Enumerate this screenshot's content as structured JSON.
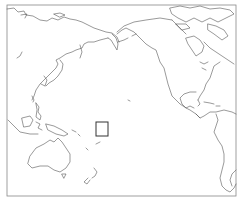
{
  "map": {
    "projection": "Pacific-centered equirectangular",
    "frame": {
      "x": 7,
      "y": 5,
      "width": 229,
      "height": 191,
      "stroke": "#888888"
    },
    "coastline_color": "#555555",
    "background": "#ffffff",
    "regions": [
      "Russia / Siberia",
      "Japan",
      "Korea",
      "China coast",
      "Philippines",
      "Indonesia",
      "Papua New Guinea",
      "Australia",
      "New Zealand",
      "Pacific Islands",
      "Alaska",
      "Canada",
      "Canadian Arctic Archipelago",
      "Greenland (partial)",
      "United States",
      "Mexico",
      "Central America",
      "Caribbean",
      "South America west coast"
    ],
    "highlight_box": {
      "label": "region-of-interest",
      "x": 96,
      "y": 122,
      "width": 12,
      "height": 14,
      "stroke": "#333333"
    }
  }
}
